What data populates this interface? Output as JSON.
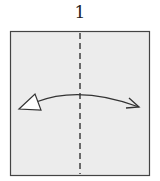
{
  "diagram": {
    "step_number": "1",
    "paper_color": "#ececec",
    "line_color": "#333333",
    "fold_line": "valley-fold-vertical-center",
    "arrow": "fold-and-unfold"
  }
}
